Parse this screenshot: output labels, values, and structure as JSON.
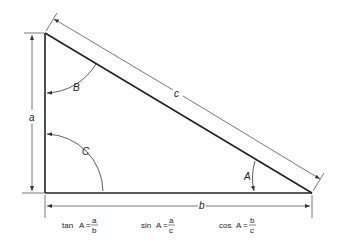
{
  "diagram": {
    "sides": [
      {
        "id": "a",
        "label": "a",
        "description": "vertical leg (height)"
      },
      {
        "id": "b",
        "label": "b",
        "description": "horizontal leg (base)"
      },
      {
        "id": "c",
        "label": "c",
        "description": "hypotenuse"
      }
    ],
    "angles": [
      {
        "id": "A",
        "label": "A",
        "vertex": "bottom-right"
      },
      {
        "id": "B",
        "label": "B",
        "vertex": "top"
      },
      {
        "id": "C",
        "label": "C",
        "vertex": "bottom-left (right angle)"
      }
    ],
    "formulas": [
      {
        "func": "tan",
        "angle": "A",
        "eq": "=",
        "numerator": "a",
        "denominator": "b"
      },
      {
        "func": "sin",
        "angle": "A",
        "eq": "=",
        "numerator": "a",
        "denominator": "c"
      },
      {
        "func": "cos",
        "angle": "A",
        "eq": "=",
        "numerator": "b",
        "denominator": "c"
      }
    ],
    "colors": {
      "line": "#222222",
      "dim_line": "#555555",
      "background": "#ffffff"
    }
  }
}
